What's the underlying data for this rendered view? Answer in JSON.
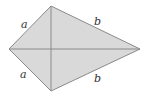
{
  "diagram": {
    "type": "kite",
    "colors": {
      "fill": "#d9d9d9",
      "stroke": "#8a8a8a",
      "label": "#333333"
    },
    "vertices": {
      "top": [
        51,
        6
      ],
      "left": [
        9,
        49
      ],
      "right": [
        140,
        49
      ],
      "bottom": [
        51,
        91
      ]
    },
    "labels": {
      "upper_left": "a",
      "lower_left": "a",
      "upper_right": "b",
      "lower_right": "b"
    }
  }
}
